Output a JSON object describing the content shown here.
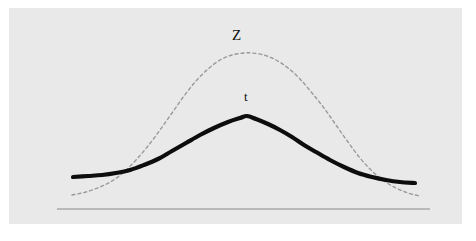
{
  "figure": {
    "title": "",
    "background_color": "#ffffff",
    "panel_color": "#e9e9e9",
    "panel_rect": {
      "x": 9,
      "y": 8,
      "width": 453,
      "height": 216
    }
  },
  "labels": {
    "z_label": "Z",
    "t_label": "t"
  },
  "chart_data": {
    "type": "line",
    "title": "",
    "subtitle": "",
    "xlabel": "",
    "ylabel": "",
    "grid": false,
    "legend_position": "inline-annotation",
    "annotations": [
      {
        "text": "Z",
        "x_px": 239,
        "y_px": 36,
        "describes": "standard normal curve"
      },
      {
        "text": "t",
        "x_px": 247,
        "y_px": 97,
        "describes": "t distribution curve"
      }
    ],
    "axis": {
      "baseline_color": "#8a8a8a",
      "baseline_y_px": 209,
      "baseline_x_start_px": 57,
      "baseline_x_end_px": 430,
      "ticks": [],
      "tick_labels": []
    },
    "series": [
      {
        "name": "Z",
        "label": "Z",
        "style": "dashed",
        "color": "#9a9a9a",
        "line_width": 1.4,
        "dash_pattern": "3 3",
        "peak_px": {
          "x": 248,
          "y": 53
        },
        "description": "standard normal distribution, taller and narrower, drawn as a fine dashed grey curve",
        "points_px": [
          [
            72,
            195
          ],
          [
            86,
            192
          ],
          [
            100,
            187
          ],
          [
            112,
            181
          ],
          [
            124,
            172
          ],
          [
            136,
            160
          ],
          [
            148,
            146
          ],
          [
            160,
            130
          ],
          [
            172,
            113
          ],
          [
            184,
            96
          ],
          [
            196,
            81
          ],
          [
            208,
            69
          ],
          [
            220,
            60
          ],
          [
            232,
            55
          ],
          [
            244,
            53
          ],
          [
            252,
            53
          ],
          [
            264,
            55
          ],
          [
            276,
            60
          ],
          [
            288,
            68
          ],
          [
            300,
            79
          ],
          [
            312,
            93
          ],
          [
            324,
            108
          ],
          [
            336,
            125
          ],
          [
            348,
            142
          ],
          [
            360,
            158
          ],
          [
            372,
            171
          ],
          [
            384,
            181
          ],
          [
            396,
            188
          ],
          [
            408,
            193
          ],
          [
            420,
            196
          ]
        ]
      },
      {
        "name": "t",
        "label": "t",
        "style": "solid",
        "color": "#0d0d0d",
        "line_width": 4.2,
        "dash_pattern": "",
        "peak_px": {
          "x": 247,
          "y": 116
        },
        "description": "t distribution, flatter with heavier tails, drawn as a thick black curve with a slightly angular apex",
        "points_px": [
          [
            73,
            177
          ],
          [
            88,
            176
          ],
          [
            102,
            175
          ],
          [
            116,
            173
          ],
          [
            130,
            170
          ],
          [
            144,
            165
          ],
          [
            158,
            159
          ],
          [
            172,
            151
          ],
          [
            186,
            143
          ],
          [
            200,
            135
          ],
          [
            214,
            128
          ],
          [
            228,
            122
          ],
          [
            240,
            118
          ],
          [
            247,
            116
          ],
          [
            256,
            119
          ],
          [
            268,
            124
          ],
          [
            280,
            130
          ],
          [
            292,
            137
          ],
          [
            304,
            145
          ],
          [
            316,
            152
          ],
          [
            330,
            160
          ],
          [
            344,
            167
          ],
          [
            358,
            173
          ],
          [
            372,
            177
          ],
          [
            386,
            180
          ],
          [
            400,
            182
          ],
          [
            415,
            183
          ]
        ]
      }
    ]
  }
}
